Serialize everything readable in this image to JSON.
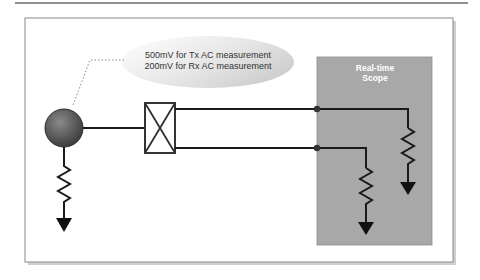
{
  "diagram": {
    "callout": {
      "line1": "500mV for Tx AC measurement",
      "line2": "200mV for Rx AC measurement"
    },
    "scope": {
      "title_line1": "Real-time",
      "title_line2": "Scope",
      "fill_color": "#a8a8a8"
    },
    "colors": {
      "wire": "#1a1a1a",
      "frame": "#888888",
      "source": "#6a6a6a"
    }
  }
}
